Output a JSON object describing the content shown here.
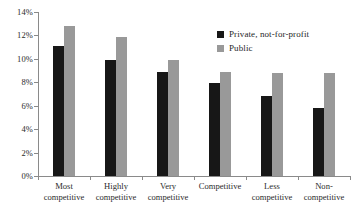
{
  "chart_data": {
    "type": "bar",
    "title": "",
    "subtitle": "",
    "xlabel": "",
    "ylabel": "",
    "ylim": [
      0,
      14
    ],
    "ytick_labels": [
      "14%",
      "12%",
      "10%",
      "8%",
      "6%",
      "4%",
      "2%",
      "0%"
    ],
    "ytick_values": [
      14,
      12,
      10,
      8,
      6,
      4,
      2,
      0
    ],
    "grid": false,
    "legend_position": "top-right",
    "value_suffix": "%",
    "categories": [
      {
        "lines": [
          "Most",
          "competitive"
        ]
      },
      {
        "lines": [
          "Highly",
          "competitive"
        ]
      },
      {
        "lines": [
          "Very",
          "competitive"
        ]
      },
      {
        "lines": [
          "Competitive"
        ]
      },
      {
        "lines": [
          "Less",
          "competitive"
        ]
      },
      {
        "lines": [
          "Non-",
          "competitive"
        ]
      }
    ],
    "series": [
      {
        "name": "Private, not-for-profit",
        "color": "#171717",
        "values": [
          11.1,
          9.9,
          8.9,
          7.9,
          6.8,
          5.8
        ]
      },
      {
        "name": "Public",
        "color": "#999999",
        "values": [
          12.8,
          11.9,
          9.9,
          8.9,
          8.8,
          8.8
        ]
      }
    ]
  }
}
